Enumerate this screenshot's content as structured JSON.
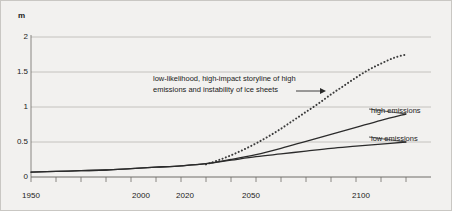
{
  "chart_data": {
    "type": "line",
    "title": "",
    "xlabel": "",
    "ylabel": "m",
    "y_unit_label": "m",
    "xlim": [
      1950,
      2110
    ],
    "ylim": [
      0,
      2.1
    ],
    "grid": true,
    "legend_position": "inline-right",
    "x_tick_labels": [
      "1950",
      "2000",
      "2020",
      "2050",
      "2100"
    ],
    "x_tick_values": [
      1950,
      2000,
      2020,
      2050,
      2100
    ],
    "x_minor_tick_interval": 10,
    "y_tick_labels": [
      "0",
      "0.5",
      "1",
      "1.5",
      "2"
    ],
    "y_tick_values": [
      0,
      0.5,
      1,
      1.5,
      2
    ],
    "series": [
      {
        "name": "low-likelihood, high-impact storyline of high emissions and instability of ice sheets",
        "style": "dotted",
        "color": "#3c3c3c",
        "x": [
          2020,
          2025,
          2030,
          2035,
          2040,
          2045,
          2050,
          2055,
          2060,
          2065,
          2070,
          2075,
          2080,
          2085,
          2090,
          2095,
          2100
        ],
        "values": [
          0.18,
          0.24,
          0.31,
          0.39,
          0.48,
          0.58,
          0.69,
          0.81,
          0.93,
          1.05,
          1.18,
          1.3,
          1.42,
          1.53,
          1.62,
          1.7,
          1.75
        ]
      },
      {
        "name": "high emissions",
        "style": "solid",
        "color": "#2b2b2b",
        "x": [
          1950,
          1960,
          1970,
          1980,
          1990,
          2000,
          2010,
          2020,
          2030,
          2040,
          2050,
          2060,
          2070,
          2080,
          2090,
          2100
        ],
        "values": [
          0.07,
          0.08,
          0.09,
          0.1,
          0.12,
          0.14,
          0.16,
          0.19,
          0.25,
          0.32,
          0.41,
          0.51,
          0.61,
          0.71,
          0.81,
          0.9
        ]
      },
      {
        "name": "low emissions",
        "style": "solid",
        "color": "#2b2b2b",
        "x": [
          1950,
          1960,
          1970,
          1980,
          1990,
          2000,
          2010,
          2020,
          2030,
          2040,
          2050,
          2060,
          2070,
          2080,
          2090,
          2100
        ],
        "values": [
          0.07,
          0.08,
          0.09,
          0.1,
          0.12,
          0.14,
          0.16,
          0.19,
          0.24,
          0.29,
          0.33,
          0.37,
          0.41,
          0.44,
          0.47,
          0.5
        ]
      }
    ],
    "annotations": [
      {
        "text_line_1": "low-likelihood, high-impact storyline of high",
        "text_line_2": "emissions and instability of ice sheets",
        "arrow": "right-arrow-to-dotted-curve",
        "points_to_year": 2080,
        "points_to_value": 1.2
      }
    ],
    "inline_labels": [
      {
        "text": "high emissions",
        "at_year": 2100,
        "at_value": 0.9
      },
      {
        "text": "low emissions",
        "at_year": 2100,
        "at_value": 0.5
      }
    ],
    "colors": {
      "background": "#f2f1ef",
      "gridline": "#b9b7b3",
      "axis": "#6e6c68",
      "border": "#c9c7c3",
      "text": "#1a1a1a"
    }
  }
}
